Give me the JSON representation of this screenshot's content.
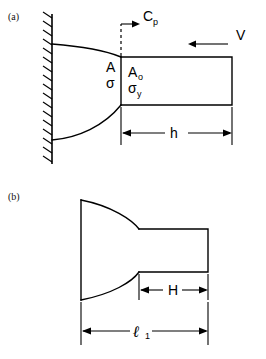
{
  "figure": {
    "background_color": "#ffffff",
    "line_color": "#000000",
    "panels": [
      {
        "id": "a",
        "label": "(a)",
        "description": "Tapered specimen fixed to a hatched rigid wall, with a uniform prismatic bar section of length h impacted at velocity V",
        "annotations": {
          "plastic_wave_speed": "C",
          "plastic_wave_speed_sub": "p",
          "area_taper": "A",
          "stress_taper": "σ",
          "area_uniform": "A",
          "area_uniform_sub": "o",
          "yield_stress": "σ",
          "yield_stress_sub": "y",
          "impact_velocity": "V",
          "length_dim": "h"
        }
      },
      {
        "id": "b",
        "label": "(b)",
        "description": "Deformed / final profile of the specimen showing uniform section length H and total length l-sub-1",
        "annotations": {
          "uniform_length": "H",
          "total_length": "ℓ",
          "total_length_sub": "1"
        }
      }
    ]
  }
}
